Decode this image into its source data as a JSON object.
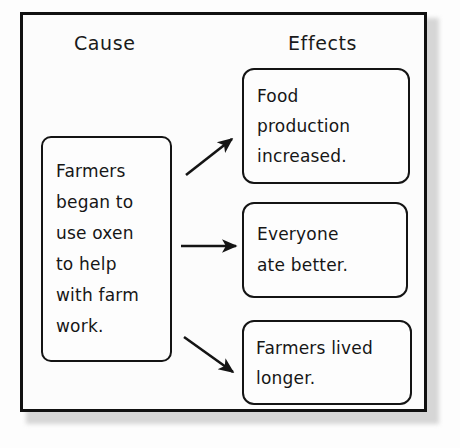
{
  "diagram": {
    "type": "cause-and-effect-chart",
    "columns": {
      "cause_header": "Cause",
      "effects_header": "Effects"
    },
    "cause": {
      "lines": [
        "Farmers",
        "began to",
        "use oxen",
        "to help",
        "with farm",
        "work."
      ],
      "full_text": "Farmers began to use oxen to help with farm work."
    },
    "effects": [
      {
        "lines": [
          "Food",
          "production",
          "increased."
        ],
        "full_text": "Food production increased."
      },
      {
        "lines": [
          "Everyone",
          "ate better."
        ],
        "full_text": "Everyone ate better."
      },
      {
        "lines": [
          "Farmers lived",
          "longer."
        ],
        "full_text": "Farmers lived longer."
      }
    ],
    "arrows": [
      {
        "name": "arrow-to-effect-1",
        "direction": "up-right"
      },
      {
        "name": "arrow-to-effect-2",
        "direction": "right"
      },
      {
        "name": "arrow-to-effect-3",
        "direction": "down-right"
      }
    ],
    "colors": {
      "ink": "#141414",
      "paper": "#fdfdfd",
      "frame": "#111111"
    }
  }
}
